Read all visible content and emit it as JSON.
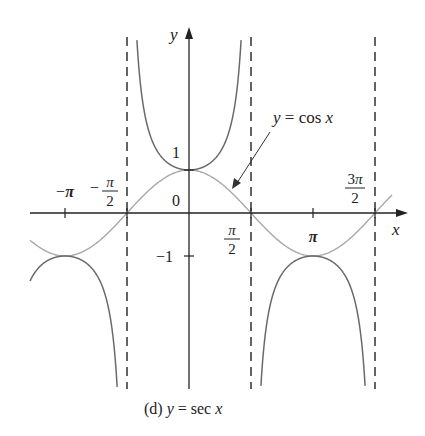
{
  "chart_data": {
    "type": "line",
    "title": "(d) y = sec x",
    "caption": {
      "prefix": "(d) ",
      "lhs": "y",
      "eq": " = sec ",
      "var": "x"
    },
    "xlabel": "x",
    "ylabel": "y",
    "xlim": [
      -3.5,
      4.95
    ],
    "ylim": [
      -4.0,
      4.2
    ],
    "grid": false,
    "x_ticks": [
      {
        "value": -3.14159,
        "label": "−π"
      },
      {
        "value": -1.5708,
        "label": "−π/2"
      },
      {
        "value": 1.5708,
        "label": "π/2"
      },
      {
        "value": 3.14159,
        "label": "π"
      },
      {
        "value": 4.71239,
        "label": "3π/2"
      }
    ],
    "y_ticks": [
      {
        "value": 1,
        "label": "1"
      },
      {
        "value": -1,
        "label": "−1"
      }
    ],
    "origin_label": "0",
    "asymptotes": [
      -1.5708,
      1.5708,
      4.71239
    ],
    "series": [
      {
        "name": "y = sec x",
        "style": "solid-dark",
        "domain": [
          -3.5,
          4.95
        ],
        "points": [
          {
            "x": -3.14159,
            "y": -1
          },
          {
            "x": 0,
            "y": 1
          },
          {
            "x": 3.14159,
            "y": -1
          }
        ]
      },
      {
        "name": "y = cos x",
        "style": "solid-light",
        "domain": [
          -3.5,
          4.95
        ],
        "points": [
          {
            "x": -3.14159,
            "y": -1
          },
          {
            "x": -1.5708,
            "y": 0
          },
          {
            "x": 0,
            "y": 1
          },
          {
            "x": 1.5708,
            "y": 0
          },
          {
            "x": 3.14159,
            "y": -1
          },
          {
            "x": 4.71239,
            "y": 0
          }
        ]
      }
    ],
    "annotations": [
      {
        "text": "y = cos x",
        "lhs": "y",
        "rhs": " = cos ",
        "var": "x",
        "arrow_to": {
          "x": 0.9,
          "y": 0.62
        }
      }
    ],
    "colors": {
      "sec": "#6a6a6a",
      "cos": "#a8a8a8",
      "axis": "#222222",
      "asymptote": "#222222"
    }
  }
}
